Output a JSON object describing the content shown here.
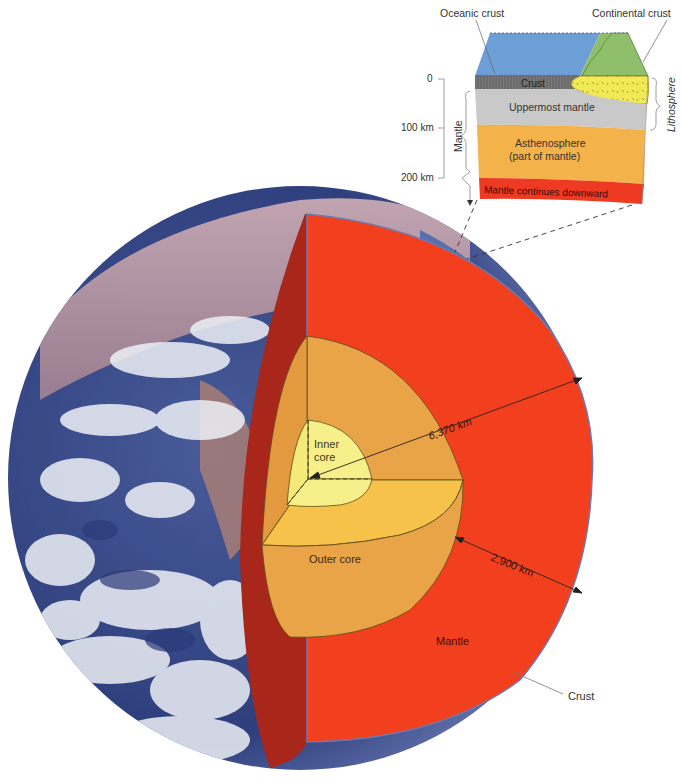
{
  "figure": {
    "globe": {
      "labels": {
        "inner_core": [
          "Inner",
          "core"
        ],
        "outer_core": "Outer core",
        "mantle": "Mantle",
        "crust": "Crust",
        "radius": "6,370 km",
        "mantle_thickness": "2,900 km"
      }
    },
    "block_diagram": {
      "labels": {
        "oceanic_crust": "Oceanic crust",
        "continental_crust": "Continental crust",
        "crust": "Crust",
        "uppermost_mantle": "Uppermost mantle",
        "asthenosphere": [
          "Asthenosphere",
          "(part of mantle)"
        ],
        "mantle_continues": "Mantle continues downward",
        "lithosphere": "Lithosphere",
        "mantle_bracket": "Mantle"
      },
      "depth_scale": [
        "0",
        "100 km",
        "200 km"
      ]
    },
    "colors": {
      "mantle": "#f2401f",
      "mantle_cut_face": "#a8261a",
      "outer_core": "#eaa448",
      "outer_core_top": "#f6c24a",
      "inner_core": "#f7f08a",
      "ocean": "#6d9fd6",
      "continent": "#8fbf6a",
      "continental_crust": "#f1ea55",
      "oceanic_crust": "#7b7b7b",
      "uppermost_mantle": "#c9c9c9",
      "asthenosphere": "#f4b24a",
      "mantle_band": "#ee3a22"
    }
  }
}
